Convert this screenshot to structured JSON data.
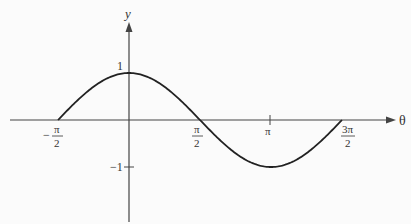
{
  "chart_data": {
    "type": "line",
    "title": "",
    "xlabel": "θ",
    "ylabel": "y",
    "function": "y = cos(θ)",
    "xlim": [
      -1.5708,
      4.7124
    ],
    "ylim": [
      -1,
      1
    ],
    "x_ticks": [
      {
        "value": -1.5708,
        "label_num": "π",
        "label_den": "2",
        "sign": "−"
      },
      {
        "value": 1.5708,
        "label_num": "π",
        "label_den": "2",
        "sign": ""
      },
      {
        "value": 3.1416,
        "label": "π"
      },
      {
        "value": 4.7124,
        "label_num": "3π",
        "label_den": "2",
        "sign": ""
      }
    ],
    "y_ticks": [
      {
        "value": 1,
        "label": "1"
      },
      {
        "value": -1,
        "label": "−1"
      }
    ],
    "x": [
      -1.5708,
      -0.7854,
      0,
      0.7854,
      1.5708,
      2.3562,
      3.1416,
      3.927,
      4.7124
    ],
    "series": [
      {
        "name": "cos θ",
        "values": [
          0,
          0.7071,
          1,
          0.7071,
          0,
          -0.7071,
          -1,
          -0.7071,
          0
        ]
      }
    ],
    "grid": false,
    "legend": null
  },
  "labels": {
    "y_axis": "y",
    "x_axis": "θ",
    "y_tick_pos": "1",
    "y_tick_neg": "−1",
    "x_tick_neg_half_pi_sign": "−",
    "x_tick_neg_half_pi_num": "π",
    "x_tick_neg_half_pi_den": "2",
    "x_tick_half_pi_num": "π",
    "x_tick_half_pi_den": "2",
    "x_tick_pi": "π",
    "x_tick_three_half_pi_num": "3π",
    "x_tick_three_half_pi_den": "2"
  }
}
